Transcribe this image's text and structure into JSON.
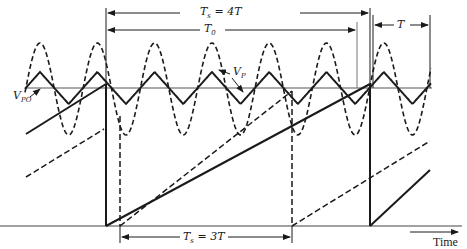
{
  "figure": {
    "labels": {
      "ts_top": {
        "main": "T",
        "sub": "s",
        "rest": " = 4T"
      },
      "t0": {
        "main": "T",
        "sub": "0"
      },
      "t_period": {
        "main": "T"
      },
      "vp": {
        "main": "V",
        "sub": "P"
      },
      "vpo": {
        "main": "V",
        "sub": "PO"
      },
      "ts_bottom": {
        "main": "T",
        "sub": "s",
        "rest": " = 3T"
      },
      "time_axis": "Time"
    },
    "colors": {
      "ink": "#1a1a1a",
      "ref_line": "#555555",
      "background": "#ffffff"
    }
  }
}
